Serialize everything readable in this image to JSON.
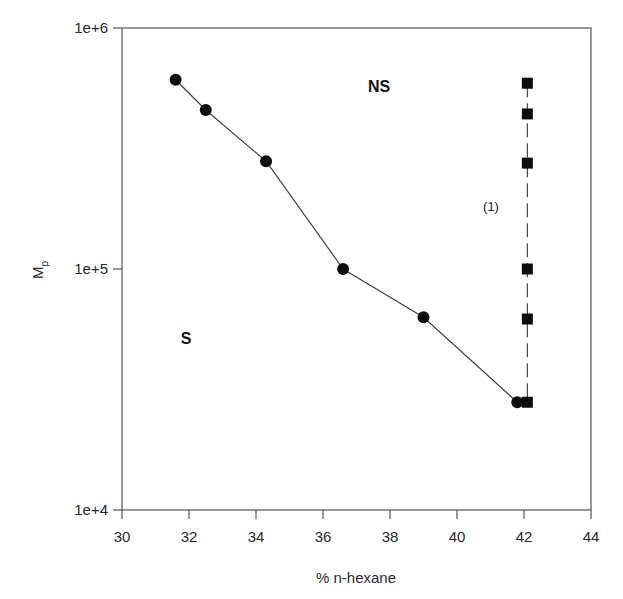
{
  "chart_data": {
    "type": "scatter",
    "title": "",
    "xlabel": "% n-hexane",
    "ylabel": "Mp",
    "ylabel_main": "M",
    "ylabel_sub": "p",
    "xlim": [
      30,
      44
    ],
    "ylim": [
      10000,
      1000000
    ],
    "yscale": "log",
    "grid": false,
    "x_ticks": [
      30,
      32,
      34,
      36,
      38,
      40,
      42,
      44
    ],
    "x_tick_labels": [
      "30",
      "32",
      "34",
      "36",
      "38",
      "40",
      "42",
      "44"
    ],
    "y_ticks": [
      10000,
      100000,
      1000000
    ],
    "y_tick_labels": [
      "1e+4",
      "1e+5",
      "1e+6"
    ],
    "series": [
      {
        "name": "cloud point curve",
        "marker": "circle",
        "line": "solid",
        "x": [
          31.6,
          32.5,
          34.3,
          36.6,
          39.0,
          41.8
        ],
        "y": [
          610000,
          457000,
          280000,
          100000,
          63000,
          28000
        ]
      },
      {
        "name": "(1)",
        "marker": "square",
        "line": "dashed",
        "x": [
          42.1,
          42.1,
          42.1,
          42.1,
          42.1,
          42.1
        ],
        "y": [
          590000,
          440000,
          275000,
          100000,
          62000,
          28000
        ]
      }
    ],
    "annotations": [
      {
        "text": "NS",
        "x": 37.8,
        "y": 570000
      },
      {
        "text": "S",
        "x": 32.0,
        "y": 44000
      },
      {
        "text": "(1)",
        "x": 41.0,
        "y": 190000
      }
    ]
  },
  "labels": {
    "x_axis_title": "% n-hexane",
    "y_axis_main": "M",
    "y_axis_sub": "p",
    "region_ns": "NS",
    "region_s": "S",
    "series_1_label": "(1)"
  }
}
